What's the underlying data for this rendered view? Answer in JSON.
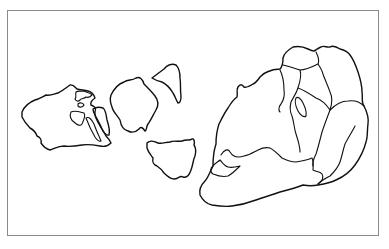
{
  "map": {
    "title": "",
    "style": {
      "stroke_color": "#111111",
      "frame_color": "#8a8a8a",
      "background": "#ffffff"
    },
    "landmasses": [
      {
        "id": "western-landmass",
        "label": ""
      },
      {
        "id": "central-island-upper",
        "label": ""
      },
      {
        "id": "central-island-wedge",
        "label": ""
      },
      {
        "id": "central-island-lower",
        "label": ""
      },
      {
        "id": "eastern-supercontinent",
        "label": ""
      }
    ],
    "caption": ""
  }
}
